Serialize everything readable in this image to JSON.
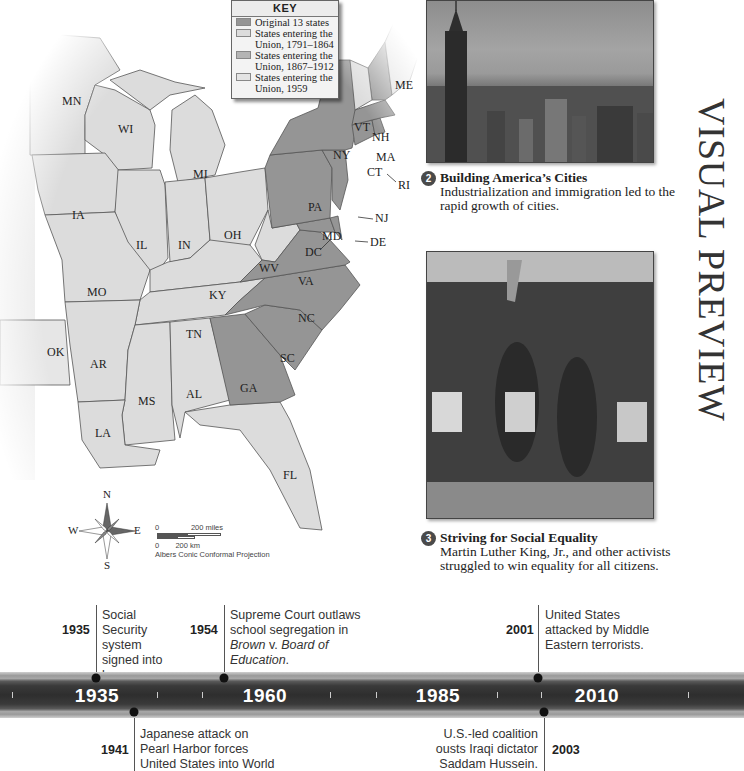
{
  "map": {
    "key": {
      "title": "KEY",
      "items": [
        {
          "label": "Original 13 states",
          "color": "#959595"
        },
        {
          "label": "States entering the Union, 1791–1864",
          "color": "#dcdcdc"
        },
        {
          "label": "States entering the Union, 1867–1912",
          "color": "#b4b4b4"
        },
        {
          "label": "States entering the Union, 1959",
          "color": "#e4e4e4"
        }
      ]
    },
    "states": [
      "MN",
      "WI",
      "MI",
      "IA",
      "IL",
      "IN",
      "OH",
      "MO",
      "KY",
      "WV",
      "VA",
      "TN",
      "NC",
      "SC",
      "GA",
      "AL",
      "MS",
      "AR",
      "LA",
      "OK",
      "FL",
      "NY",
      "PA",
      "VT",
      "NH",
      "ME",
      "MA",
      "CT",
      "RI",
      "NJ",
      "DE",
      "MD",
      "DC"
    ],
    "compass": {
      "n": "N",
      "s": "S",
      "e": "E",
      "w": "W"
    },
    "scale": {
      "miles_zero": "0",
      "miles_label": "200 miles",
      "km_zero": "0",
      "km_label": "200 km",
      "projection": "Albers Conic Conformal Projection"
    },
    "colors": {
      "original": "#959595",
      "later": "#dcdcdc",
      "outline": "#555555"
    }
  },
  "sidebar_title": "VISUAL PREVIEW",
  "features": [
    {
      "number": "2",
      "title": "Building America’s Cities",
      "text": "Industrialization and immigration led to the rapid growth of cities."
    },
    {
      "number": "3",
      "title": "Striving for Social Equality",
      "text": "Martin Luther King, Jr., and other activists struggled to win equality for all citizens."
    }
  ],
  "timeline": {
    "eras": [
      "1935",
      "1960",
      "1985",
      "2010"
    ],
    "events_above": [
      {
        "year": "1935",
        "text": "Social Security system signed into law."
      },
      {
        "year": "1954",
        "text_plain": "Supreme Court outlaws school segregation in ",
        "text_italic1": "Brown",
        "text_mid": " v. ",
        "text_italic2": "Board of Education",
        "text_end": "."
      },
      {
        "year": "2001",
        "text": "United States attacked by Middle Eastern terrorists."
      }
    ],
    "events_below": [
      {
        "year": "1941",
        "text": "Japanese attack on Pearl Harbor forces United States into World War II."
      },
      {
        "year": "2003",
        "text": "U.S.-led coalition ousts Iraqi dictator Saddam Hussein."
      }
    ]
  }
}
